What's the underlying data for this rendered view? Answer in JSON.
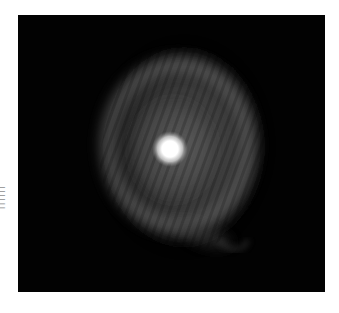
{
  "figure": {
    "side_label": "||||||",
    "colors": {
      "background": "#ffffff",
      "sky": "#020202",
      "nebula_shell": "#6a6a6a",
      "nebula_glow": "#3a3a3a",
      "central_star": "#ffffff"
    }
  }
}
